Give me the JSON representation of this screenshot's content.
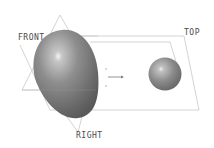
{
  "viewport": {
    "background": "#ffffff",
    "datum_planes": [
      {
        "name": "FRONT",
        "label_pos": [
          18,
          35
        ]
      },
      {
        "name": "TOP",
        "label_pos": [
          184,
          30
        ]
      },
      {
        "name": "RIGHT",
        "label_pos": [
          76,
          132
        ]
      }
    ],
    "bodies": [
      {
        "type": "ellipsoid",
        "name": "large-body"
      },
      {
        "type": "sphere",
        "name": "small-sphere"
      }
    ],
    "colors": {
      "plane_line": "#c8c8c8",
      "body_base": "#7a7a7a",
      "highlight": "#f2f2f2",
      "label": "#4a4a4a"
    }
  },
  "labels": {
    "front": "FRONT",
    "top": "TOP",
    "right": "RIGHT"
  }
}
